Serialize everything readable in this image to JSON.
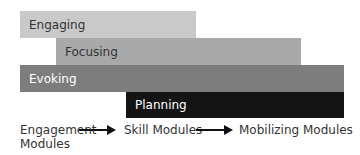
{
  "diagram": {
    "bars": [
      {
        "label": "Engaging",
        "color": "#c9c9c9",
        "text_color": "#333333"
      },
      {
        "label": "Focusing",
        "color": "#a9a9a9",
        "text_color": "#333333"
      },
      {
        "label": "Evoking",
        "color": "#7d7d7d",
        "text_color": "#ffffff"
      },
      {
        "label": "Planning",
        "color": "#141414",
        "text_color": "#ffffff"
      }
    ],
    "flow": {
      "step1": "Engagement",
      "step1_line2": "Modules",
      "step2": "Skill Modules",
      "step3": "Mobilizing Modules"
    }
  }
}
